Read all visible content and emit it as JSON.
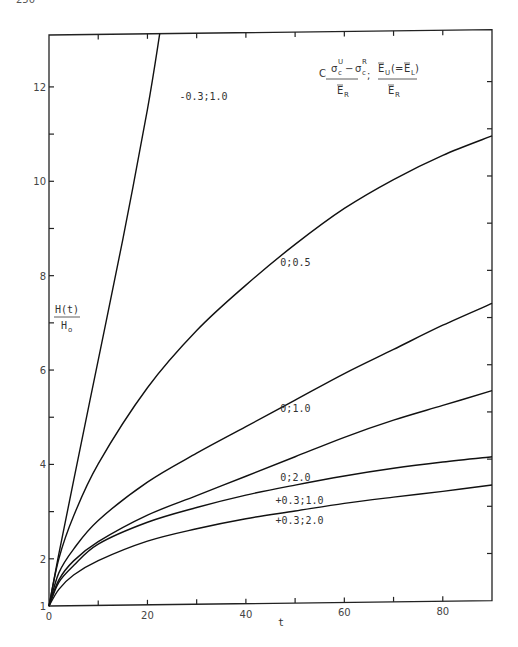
{
  "page_number": "250",
  "chart_data": {
    "type": "line",
    "title": "",
    "xlabel": "t",
    "ylabel": "H(t) / H_o",
    "ylabel_numerator": "H(t)",
    "ylabel_denominator": "H",
    "ylabel_denominator_sub": "o",
    "xlim": [
      0,
      90
    ],
    "ylim": [
      1,
      13.1
    ],
    "x_ticks": [
      0,
      10,
      20,
      30,
      40,
      50,
      60,
      70,
      80
    ],
    "x_tick_labels": [
      {
        "value": 0,
        "label": "0"
      },
      {
        "value": 20,
        "label": "20"
      },
      {
        "value": 40,
        "label": "40"
      },
      {
        "value": 60,
        "label": "60"
      },
      {
        "value": 80,
        "label": "80"
      }
    ],
    "y_ticks": [
      1,
      2,
      3,
      4,
      5,
      6,
      7,
      8,
      9,
      10,
      11,
      12
    ],
    "y_tick_labels": [
      {
        "value": 1,
        "label": "1"
      },
      {
        "value": 2,
        "label": "2"
      },
      {
        "value": 4,
        "label": "4"
      },
      {
        "value": 6,
        "label": "6"
      },
      {
        "value": 8,
        "label": "8"
      },
      {
        "value": 10,
        "label": "10"
      },
      {
        "value": 12,
        "label": "12"
      }
    ],
    "grid": false,
    "legend": {
      "position": "top-right",
      "param1_prefix": "C",
      "param1_numerator": "σ^U_c − σ^R_c",
      "param1_denominator": "Ē_R",
      "separator": ";",
      "param2_numerator": "Ē_U(=Ē_L)",
      "param2_denominator": "Ē_R"
    },
    "series": [
      {
        "name": "-0.3;1.0",
        "label": "-0.3;1.0",
        "label_at": [
          26.5,
          11.7
        ],
        "x": [
          0,
          2,
          5,
          10,
          15,
          20,
          22.5
        ],
        "y": [
          1,
          2.1,
          3.65,
          6.2,
          8.75,
          11.5,
          13.1
        ]
      },
      {
        "name": "0;0.5",
        "label": "0;0.5",
        "label_at": [
          47,
          8.15
        ],
        "x": [
          0,
          2,
          5,
          10,
          20,
          30,
          40,
          50,
          60,
          70,
          80,
          90
        ],
        "y": [
          1,
          2.0,
          2.9,
          4.0,
          5.6,
          6.8,
          7.75,
          8.6,
          9.35,
          9.95,
          10.45,
          10.85
        ]
      },
      {
        "name": "0;1.0",
        "label": "0;1.0",
        "label_at": [
          47,
          5.05
        ],
        "x": [
          0,
          2,
          5,
          10,
          20,
          30,
          40,
          50,
          60,
          70,
          80,
          90
        ],
        "y": [
          1,
          1.7,
          2.2,
          2.8,
          3.6,
          4.2,
          4.75,
          5.3,
          5.85,
          6.35,
          6.85,
          7.3
        ]
      },
      {
        "name": "0;2.0",
        "label": "0;2.0",
        "label_at": [
          47,
          3.6
        ],
        "x": [
          0,
          2,
          5,
          10,
          20,
          30,
          40,
          50,
          60,
          70,
          80,
          90
        ],
        "y": [
          1,
          1.55,
          1.95,
          2.35,
          2.9,
          3.3,
          3.7,
          4.1,
          4.5,
          4.85,
          5.15,
          5.45
        ]
      },
      {
        "name": "+0.3;1.0",
        "label": "+0.3;1.0",
        "label_at": [
          46,
          3.1
        ],
        "x": [
          0,
          2,
          5,
          10,
          20,
          30,
          40,
          50,
          60,
          70,
          80,
          90
        ],
        "y": [
          1,
          1.5,
          1.85,
          2.3,
          2.75,
          3.05,
          3.3,
          3.5,
          3.68,
          3.83,
          3.95,
          4.05
        ]
      },
      {
        "name": "+0.3;2.0",
        "label": "+0.3;2.0",
        "label_at": [
          46,
          2.68
        ],
        "x": [
          0,
          2,
          5,
          10,
          20,
          30,
          40,
          50,
          60,
          70,
          80,
          90
        ],
        "y": [
          1,
          1.35,
          1.65,
          1.95,
          2.35,
          2.6,
          2.8,
          2.95,
          3.1,
          3.22,
          3.33,
          3.45
        ]
      }
    ]
  }
}
